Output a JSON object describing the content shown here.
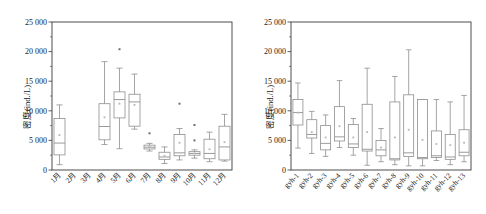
{
  "figure": {
    "background": "#ffffff",
    "box_stroke": "#8e8e8e",
    "frame_stroke": "#3a3a3a",
    "mean_marker_color": "#b6b6b6",
    "outlier_color": "#6f6f6f"
  },
  "chart_data": [
    {
      "type": "box",
      "panel": "left",
      "title": "",
      "xlabel": "",
      "ylabel": "密度(ind./L)",
      "ylim": [
        0,
        25000
      ],
      "yticks": [
        0,
        5000,
        10000,
        15000,
        20000,
        25000
      ],
      "ytick_labels": [
        "0",
        "5 000",
        "10 000",
        "15 000",
        "20 000",
        "25 000"
      ],
      "grid": false,
      "legend": "none",
      "categories": [
        "1月",
        "2月",
        "3月",
        "4月",
        "5月",
        "6月",
        "7月",
        "8月",
        "9月",
        "10月",
        "11月",
        "12月"
      ],
      "boxes": [
        {
          "category": "1月",
          "min": 900,
          "q1": 2550,
          "median": 4550,
          "q3": 8700,
          "max": 11000,
          "mean": 5900,
          "outliers": []
        },
        {
          "category": "2月",
          "min": null,
          "q1": null,
          "median": null,
          "q3": null,
          "max": null,
          "mean": null,
          "outliers": []
        },
        {
          "category": "3月",
          "min": null,
          "q1": null,
          "median": null,
          "q3": null,
          "max": null,
          "mean": null,
          "outliers": []
        },
        {
          "category": "4月",
          "min": 4300,
          "q1": 5100,
          "median": 7350,
          "q3": 11200,
          "max": 18300,
          "mean": 8900,
          "outliers": []
        },
        {
          "category": "5月",
          "min": 3600,
          "q1": 8800,
          "median": 11900,
          "q3": 13200,
          "max": 17200,
          "mean": 11200,
          "outliers": [
            20400
          ]
        },
        {
          "category": "6月",
          "min": 6900,
          "q1": 7400,
          "median": 11500,
          "q3": 12800,
          "max": 16200,
          "mean": 11000,
          "outliers": []
        },
        {
          "category": "7月",
          "min": 3200,
          "q1": 3550,
          "median": 3850,
          "q3": 4200,
          "max": 4500,
          "mean": 3900,
          "outliers": [
            6200
          ]
        },
        {
          "category": "8月",
          "min": 1100,
          "q1": 1800,
          "median": 2200,
          "q3": 3000,
          "max": 3900,
          "mean": 2400,
          "outliers": []
        },
        {
          "category": "9月",
          "min": 1700,
          "q1": 2400,
          "median": 2900,
          "q3": 6000,
          "max": 7000,
          "mean": 4600,
          "outliers": [
            11200
          ]
        },
        {
          "category": "10月",
          "min": 2000,
          "q1": 2500,
          "median": 2800,
          "q3": 3100,
          "max": 3400,
          "mean": 2800,
          "outliers": [
            7600,
            5000
          ]
        },
        {
          "category": "11月",
          "min": 1400,
          "q1": 1900,
          "median": 2800,
          "q3": 5200,
          "max": 6400,
          "mean": 3500,
          "outliers": []
        },
        {
          "category": "12月",
          "min": 1500,
          "q1": 1700,
          "median": 3900,
          "q3": 7400,
          "max": 9400,
          "mean": 4700,
          "outliers": []
        }
      ]
    },
    {
      "type": "box",
      "panel": "right",
      "title": "",
      "xlabel": "",
      "ylabel": "密度(ind./L)",
      "ylim": [
        0,
        25000
      ],
      "yticks": [
        0,
        5000,
        10000,
        15000,
        20000,
        25000
      ],
      "ytick_labels": [
        "0",
        "5 000",
        "10 000",
        "15 000",
        "20 000",
        "25 000"
      ],
      "grid": false,
      "legend": "none",
      "categories": [
        "gyh-1",
        "gyh-2",
        "gyh-3",
        "gyh-4",
        "gyh-5",
        "gyh-6",
        "gyh-7",
        "gyh-8",
        "gyh-9",
        "gyh-10",
        "gyh-11",
        "gyh-12",
        "gyh-13"
      ],
      "boxes": [
        {
          "category": "gyh-1",
          "min": 3700,
          "q1": 7600,
          "median": 9700,
          "q3": 11900,
          "max": 14700,
          "mean": 9700,
          "outliers": []
        },
        {
          "category": "gyh-2",
          "min": 2800,
          "q1": 5400,
          "median": 6000,
          "q3": 8500,
          "max": 9900,
          "mean": 6400,
          "outliers": []
        },
        {
          "category": "gyh-3",
          "min": 2300,
          "q1": 3400,
          "median": 4500,
          "q3": 7500,
          "max": 9300,
          "mean": 5500,
          "outliers": []
        },
        {
          "category": "gyh-4",
          "min": 3800,
          "q1": 4900,
          "median": 5600,
          "q3": 10700,
          "max": 15100,
          "mean": 7400,
          "outliers": []
        },
        {
          "category": "gyh-5",
          "min": 2500,
          "q1": 3800,
          "median": 4400,
          "q3": 7700,
          "max": 8700,
          "mean": 5500,
          "outliers": []
        },
        {
          "category": "gyh-6",
          "min": 800,
          "q1": 3200,
          "median": 3500,
          "q3": 11100,
          "max": 17200,
          "mean": 6400,
          "outliers": []
        },
        {
          "category": "gyh-7",
          "min": 1400,
          "q1": 2400,
          "median": 3400,
          "q3": 5000,
          "max": 7000,
          "mean": 3800,
          "outliers": []
        },
        {
          "category": "gyh-8",
          "min": 900,
          "q1": 1700,
          "median": 1900,
          "q3": 11500,
          "max": 15800,
          "mean": 5500,
          "outliers": []
        },
        {
          "category": "gyh-9",
          "min": 700,
          "q1": 2300,
          "median": 2900,
          "q3": 12700,
          "max": 20300,
          "mean": 6800,
          "outliers": []
        },
        {
          "category": "gyh-10",
          "min": 700,
          "q1": 1900,
          "median": 2100,
          "q3": 11900,
          "max": 11900,
          "mean": 5100,
          "outliers": []
        },
        {
          "category": "gyh-11",
          "min": 1600,
          "q1": 2100,
          "median": 2400,
          "q3": 6600,
          "max": 11900,
          "mean": 4400,
          "outliers": []
        },
        {
          "category": "gyh-12",
          "min": 900,
          "q1": 1800,
          "median": 2200,
          "q3": 6000,
          "max": 11500,
          "mean": 4200,
          "outliers": []
        },
        {
          "category": "gyh-13",
          "min": 1400,
          "q1": 2400,
          "median": 3000,
          "q3": 6800,
          "max": 12600,
          "mean": 4600,
          "outliers": []
        }
      ]
    }
  ]
}
